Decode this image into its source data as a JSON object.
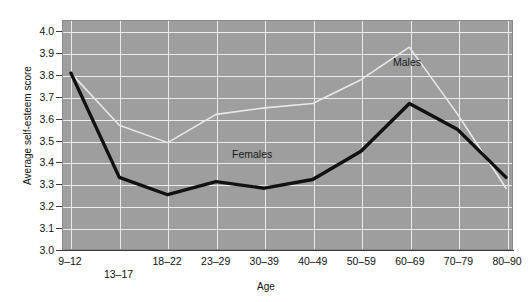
{
  "chart_data": {
    "type": "line",
    "title": "",
    "xlabel": "Age",
    "ylabel": "Average self-esteem score",
    "categories": [
      "9–12",
      "13–17",
      "18–22",
      "23–29",
      "30–39",
      "40–49",
      "50–59",
      "60–69",
      "70–79",
      "80–90"
    ],
    "ylim": [
      3.0,
      4.0
    ],
    "ytick_step": 0.1,
    "yticks": [
      "4.0",
      "3.9",
      "3.8",
      "3.7",
      "3.6",
      "3.5",
      "3.4",
      "3.3",
      "3.2",
      "3.1",
      "3.0"
    ],
    "grid": true,
    "legend": "inline-annotations",
    "series": [
      {
        "name": "Males",
        "color": "#e8e8e8",
        "line_width": 1.6,
        "values": [
          3.81,
          3.57,
          3.49,
          3.62,
          3.65,
          3.67,
          3.78,
          3.93,
          3.62,
          3.28
        ],
        "label": {
          "text": "Males",
          "x_px": 393,
          "y_px": 56
        }
      },
      {
        "name": "Females",
        "color": "#111111",
        "line_width": 3.4,
        "values": [
          3.81,
          3.33,
          3.25,
          3.31,
          3.28,
          3.32,
          3.45,
          3.67,
          3.55,
          3.33
        ],
        "label": {
          "text": "Females",
          "x_px": 232,
          "y_px": 148
        }
      }
    ]
  },
  "figure": {
    "background": "#ffffff",
    "plot_background": "#9e9e9e",
    "gridline_color": "#f2f2f2",
    "axis_color": "#3a3a3a"
  }
}
